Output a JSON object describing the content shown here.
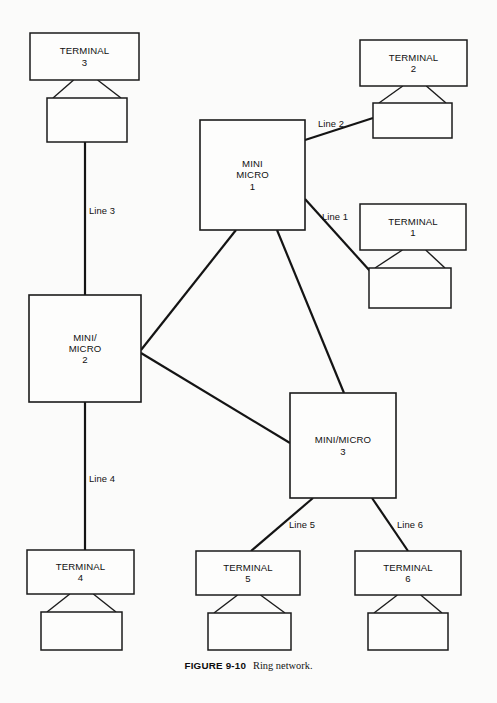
{
  "figure": {
    "caption_id": "FIGURE 9-10",
    "caption_text": "Ring network.",
    "caption_y": 655,
    "background_color": "#fbfbfa",
    "ink_color": "#141414"
  },
  "chart_data": {
    "type": "diagram",
    "subtype": "network-topology",
    "title": "Ring network.",
    "figure_number": "9-10",
    "nodes": [
      {
        "id": "mini-micro-1",
        "kind": "computer",
        "label_lines": [
          "MINI",
          "MICRO",
          "1"
        ],
        "x": 200,
        "y": 120,
        "w": 105,
        "h": 110
      },
      {
        "id": "mini-micro-2",
        "kind": "computer",
        "label_lines": [
          "MINI/",
          "MICRO",
          "2"
        ],
        "x": 29,
        "y": 295,
        "w": 112,
        "h": 107
      },
      {
        "id": "mini-micro-3",
        "kind": "computer",
        "label_lines": [
          "MINI/MICRO",
          "3"
        ],
        "x": 290,
        "y": 393,
        "w": 106,
        "h": 105
      }
    ],
    "terminals": [
      {
        "id": "terminal-3",
        "label_lines": [
          "TERMINAL",
          "3"
        ],
        "screen": {
          "x": 30,
          "y": 33,
          "w": 109,
          "h": 47
        },
        "base": {
          "x": 47,
          "y": 98,
          "w": 80,
          "h": 44
        }
      },
      {
        "id": "terminal-2",
        "label_lines": [
          "TERMINAL",
          "2"
        ],
        "screen": {
          "x": 360,
          "y": 40,
          "w": 107,
          "h": 46
        },
        "base": {
          "x": 373,
          "y": 103,
          "w": 79,
          "h": 35
        }
      },
      {
        "id": "terminal-1",
        "label_lines": [
          "TERMINAL",
          "1"
        ],
        "screen": {
          "x": 360,
          "y": 204,
          "w": 106,
          "h": 46
        },
        "base": {
          "x": 369,
          "y": 268,
          "w": 82,
          "h": 40
        }
      },
      {
        "id": "terminal-4",
        "label_lines": [
          "TERMINAL",
          "4"
        ],
        "screen": {
          "x": 27,
          "y": 550,
          "w": 107,
          "h": 44
        },
        "base": {
          "x": 41,
          "y": 612,
          "w": 81,
          "h": 38
        }
      },
      {
        "id": "terminal-5",
        "label_lines": [
          "TERMINAL",
          "5"
        ],
        "screen": {
          "x": 196,
          "y": 551,
          "w": 104,
          "h": 44
        },
        "base": {
          "x": 208,
          "y": 613,
          "w": 83,
          "h": 37
        }
      },
      {
        "id": "terminal-6",
        "label_lines": [
          "TERMINAL",
          "6"
        ],
        "screen": {
          "x": 355,
          "y": 551,
          "w": 106,
          "h": 44
        },
        "base": {
          "x": 368,
          "y": 613,
          "w": 80,
          "h": 37
        }
      }
    ],
    "links": [
      {
        "id": "line-1",
        "label": "Line 1",
        "from": "mini-micro-1",
        "to": "terminal-1",
        "x1": 305,
        "y1": 199,
        "x2": 370,
        "y2": 271,
        "label_x": 322,
        "label_y": 220
      },
      {
        "id": "line-2",
        "label": "Line 2",
        "from": "mini-micro-1",
        "to": "terminal-2",
        "x1": 305,
        "y1": 140,
        "x2": 373,
        "y2": 118,
        "label_x": 318,
        "label_y": 127
      },
      {
        "id": "line-3",
        "label": "Line 3",
        "from": "terminal-3",
        "to": "mini-micro-2",
        "x1": 85,
        "y1": 142,
        "x2": 85,
        "y2": 295,
        "label_x": 89,
        "label_y": 214
      },
      {
        "id": "line-4",
        "label": "Line 4",
        "from": "mini-micro-2",
        "to": "terminal-4",
        "x1": 85,
        "y1": 402,
        "x2": 85,
        "y2": 550,
        "label_x": 89,
        "label_y": 482
      },
      {
        "id": "line-5",
        "label": "Line 5",
        "from": "mini-micro-3",
        "to": "terminal-5",
        "x1": 313,
        "y1": 498,
        "x2": 251,
        "y2": 551,
        "label_x": 289,
        "label_y": 528
      },
      {
        "id": "line-6",
        "label": "Line 6",
        "from": "mini-micro-3",
        "to": "terminal-6",
        "x1": 372,
        "y1": 498,
        "x2": 408,
        "y2": 551,
        "label_x": 397,
        "label_y": 528
      },
      {
        "id": "trunk-mm1-mm2",
        "label": "",
        "from": "mini-micro-1",
        "to": "mini-micro-2",
        "x1": 236,
        "y1": 230,
        "x2": 141,
        "y2": 350,
        "label_x": null,
        "label_y": null
      },
      {
        "id": "trunk-mm1-mm3",
        "label": "",
        "from": "mini-micro-1",
        "to": "mini-micro-3",
        "x1": 277,
        "y1": 230,
        "x2": 344,
        "y2": 393,
        "label_x": null,
        "label_y": null
      },
      {
        "id": "trunk-mm2-mm3",
        "label": "",
        "from": "mini-micro-2",
        "to": "mini-micro-3",
        "x1": 141,
        "y1": 353,
        "x2": 290,
        "y2": 443,
        "label_x": null,
        "label_y": null
      }
    ]
  }
}
